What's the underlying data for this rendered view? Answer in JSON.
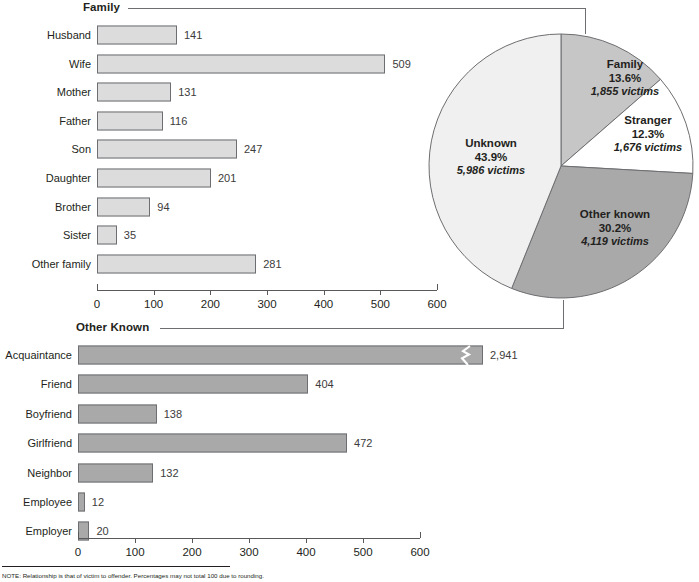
{
  "sections": {
    "family_label": "Family",
    "other_known_label": "Other Known"
  },
  "note": "NOTE: Relationship is that of victim to offender. Percentages may not total 100 due to rounding.",
  "colors": {
    "family_bar_fill": "#dcdcdc",
    "other_known_bar_fill": "#a9a9a9",
    "bar_stroke": "#6d6e71",
    "pie_family": "#c6c6c6",
    "pie_stranger": "#ffffff",
    "pie_other_known": "#a9a9a9",
    "pie_unknown": "#f0f0f0",
    "text": "#231f20"
  },
  "chart_data": [
    {
      "type": "bar",
      "title": "Family",
      "orientation": "horizontal",
      "xlabel": "",
      "ylabel": "",
      "xlim": [
        0,
        600
      ],
      "xticks": [
        0,
        100,
        200,
        300,
        400,
        500,
        600
      ],
      "grid": false,
      "categories": [
        "Husband",
        "Wife",
        "Mother",
        "Father",
        "Son",
        "Daughter",
        "Brother",
        "Sister",
        "Other family"
      ],
      "values": [
        141,
        509,
        131,
        116,
        247,
        201,
        94,
        35,
        281
      ],
      "value_labels": [
        "141",
        "509",
        "131",
        "116",
        "247",
        "201",
        "94",
        "35",
        "281"
      ]
    },
    {
      "type": "pie",
      "title": "",
      "legend_position": "inside-slices",
      "labels": [
        "Family",
        "Stranger",
        "Other known",
        "Unknown"
      ],
      "percents": [
        13.6,
        12.3,
        30.2,
        43.9
      ],
      "percent_labels": [
        "13.6%",
        "12.3%",
        "30.2%",
        "43.9%"
      ],
      "values": [
        1855,
        1676,
        4119,
        5986
      ],
      "value_labels": [
        "1,855 victims",
        "1,676 victims",
        "4,119 victims",
        "5,986 victims"
      ],
      "slice_colors": [
        "#c6c6c6",
        "#ffffff",
        "#a9a9a9",
        "#f0f0f0"
      ],
      "start_angle_deg": 0,
      "direction": "clockwise"
    },
    {
      "type": "bar",
      "title": "Other Known",
      "orientation": "horizontal",
      "xlabel": "",
      "ylabel": "",
      "xlim": [
        0,
        600
      ],
      "xticks": [
        0,
        100,
        200,
        300,
        400,
        500,
        600
      ],
      "grid": false,
      "axis_break": true,
      "axis_break_category": "Acquaintance",
      "categories": [
        "Acquaintance",
        "Friend",
        "Boyfriend",
        "Girlfriend",
        "Neighbor",
        "Employee",
        "Employer"
      ],
      "values": [
        2941,
        404,
        138,
        472,
        132,
        12,
        20
      ],
      "value_labels": [
        "2,941",
        "404",
        "138",
        "472",
        "132",
        "12",
        "20"
      ]
    }
  ]
}
